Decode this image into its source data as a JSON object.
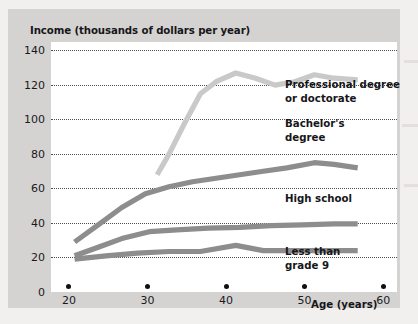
{
  "chart_data": {
    "type": "line",
    "title": "",
    "ylabel": "Income (thousands of dollars per year)",
    "xlabel": "Age (years)",
    "xlim": [
      18,
      62
    ],
    "ylim": [
      0,
      145
    ],
    "xticks": [
      20,
      30,
      40,
      50,
      60
    ],
    "yticks": [
      0,
      20,
      40,
      60,
      80,
      100,
      120,
      140
    ],
    "xtick_labels": [
      "20",
      "30",
      "40",
      "50",
      "60"
    ],
    "ytick_labels": [
      "0",
      "20",
      "40",
      "60",
      "80",
      "100",
      "120",
      "140"
    ],
    "grid": "horizontal dotted gridlines at every y tick",
    "legend_position": "inline labels at right of each curve",
    "series": [
      {
        "name": "Professional degree or doctorate",
        "color": "#c9c9c9",
        "label_lines": "Professional degree\nor doctorate",
        "x": [
          31.5,
          33,
          35,
          37,
          39,
          41.5,
          44,
          46.5,
          49,
          51.5,
          54,
          57
        ],
        "y": [
          68,
          80,
          98,
          115,
          122,
          127,
          124,
          120,
          122,
          126,
          124,
          123
        ]
      },
      {
        "name": "Bachelor's degree",
        "color": "#8d8d8d",
        "label_lines": "Bachelor's\ndegree",
        "x": [
          21,
          24,
          27,
          30,
          33,
          36,
          39,
          42,
          45,
          48,
          51.5,
          54,
          57
        ],
        "y": [
          29,
          39,
          49,
          57,
          61,
          64,
          66,
          68,
          70,
          72,
          75,
          74,
          72
        ]
      },
      {
        "name": "High school",
        "color": "#8d8d8d",
        "label_lines": "High school",
        "x": [
          21,
          24,
          27,
          30.5,
          34,
          38,
          42,
          46,
          50,
          54,
          57
        ],
        "y": [
          21,
          26,
          31,
          35,
          36,
          37,
          37.5,
          38.5,
          39,
          39.5,
          39.5
        ]
      },
      {
        "name": "Less than grade 9",
        "color": "#8d8d8d",
        "label_lines": "Less than\ngrade 9",
        "x": [
          21,
          25,
          29,
          33,
          37,
          41.5,
          45,
          49,
          53,
          57
        ],
        "y": [
          19,
          21,
          22.5,
          23.5,
          23.5,
          27,
          24,
          24,
          24,
          24
        ]
      }
    ]
  },
  "axes": {
    "y_title": "Income (thousands of dollars per year)",
    "x_title": "Age (years)"
  },
  "labels": {
    "professional": "Professional degree\nor doctorate",
    "bachelors": "Bachelor's\ndegree",
    "high_school": "High school",
    "less_than_grade9": "Less than\ngrade 9"
  },
  "colors": {
    "panel_background": "#d5d3d1",
    "plot_background": "#ffffff",
    "gridline": "#4d4d52",
    "light_series": "#c9c9c9",
    "dark_series": "#8d8d8d",
    "text": "#16161a"
  }
}
